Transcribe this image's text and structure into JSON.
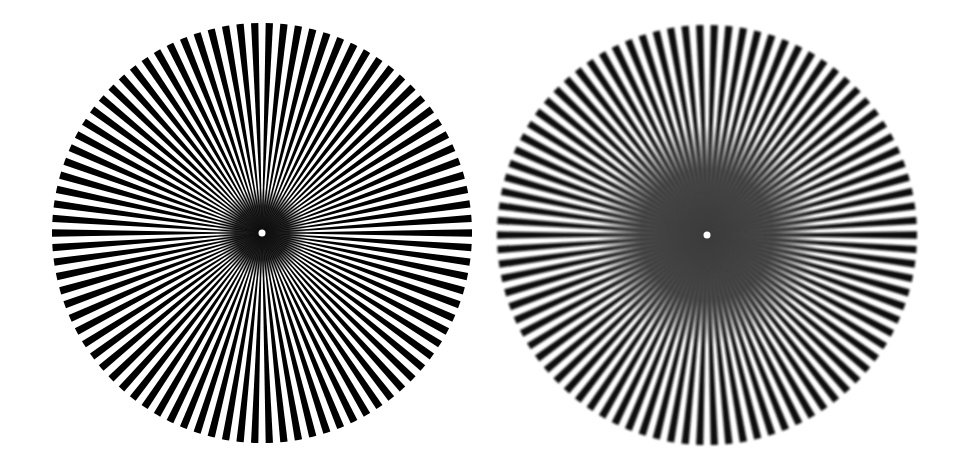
{
  "figure": {
    "background": "#ffffff",
    "stars": [
      {
        "name": "sharp-siemens-star",
        "cx": 262,
        "cy": 233,
        "r": 210,
        "spokes": 90,
        "spoke_color": "#000000",
        "blur": 0.35,
        "core_radius": 45,
        "core_color": "#0a0a0a",
        "center_dot_color": "#ffffff"
      },
      {
        "name": "blurred-siemens-star",
        "cx": 707,
        "cy": 235,
        "r": 210,
        "spokes": 90,
        "spoke_color": "#111111",
        "blur": 1.3,
        "core_radius": 110,
        "core_color": "#3a3a3a",
        "center_dot_color": "#ffffff"
      }
    ]
  }
}
